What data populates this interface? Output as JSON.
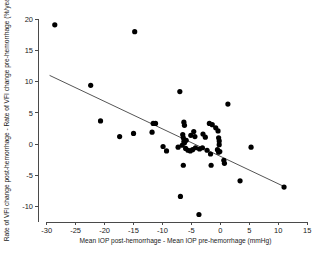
{
  "chart_data": {
    "type": "scatter",
    "title": "",
    "xlabel": "Mean IOP post-hemorrhage - Mean IOP pre-hemorrhage (mmHg)",
    "ylabel": "Rate of VFI change post-hemorrhage - Rate of VFI change pre-hemorrhage (%/year)",
    "xlim": [
      -31.5,
      16.0
    ],
    "ylim": [
      -12.5,
      21.0
    ],
    "xticks": [
      -30,
      -25,
      -20,
      -15,
      -10,
      -5,
      0,
      5,
      10,
      15
    ],
    "yticks": [
      -10,
      -5,
      0,
      5,
      10,
      15,
      20
    ],
    "xtick_labels": [
      "-30",
      "-25",
      "-20",
      "-15",
      "-10",
      "-5",
      "0",
      "5",
      "10",
      "15"
    ],
    "ytick_labels": [
      "-10",
      "-5",
      "0",
      "5",
      "10",
      "15",
      "20"
    ],
    "grid": false,
    "legend": false,
    "marker": "filled-circle",
    "marker_color": "#000000",
    "fit_line": {
      "label": "linear regression",
      "color": "#555555",
      "x_start": -29.5,
      "y_start": 11.0,
      "x_end": 11.2,
      "y_end": -6.9
    },
    "points": [
      {
        "x": -28.6,
        "y": 19.1
      },
      {
        "x": -14.8,
        "y": 18.0
      },
      {
        "x": -22.4,
        "y": 9.4
      },
      {
        "x": -7.0,
        "y": 8.4
      },
      {
        "x": 1.3,
        "y": 6.4
      },
      {
        "x": -20.7,
        "y": 3.7
      },
      {
        "x": -11.6,
        "y": 3.3
      },
      {
        "x": -11.2,
        "y": 3.3
      },
      {
        "x": -6.3,
        "y": 3.5
      },
      {
        "x": -6.2,
        "y": 3.0
      },
      {
        "x": -1.9,
        "y": 3.3
      },
      {
        "x": -1.4,
        "y": 3.1
      },
      {
        "x": -0.8,
        "y": 2.6
      },
      {
        "x": -0.4,
        "y": 2.1
      },
      {
        "x": -15.0,
        "y": 1.7
      },
      {
        "x": -17.4,
        "y": 1.2
      },
      {
        "x": -11.8,
        "y": 1.9
      },
      {
        "x": -6.5,
        "y": 1.5
      },
      {
        "x": -6.4,
        "y": 1.0
      },
      {
        "x": -6.3,
        "y": 0.4
      },
      {
        "x": -6.2,
        "y": 0.2
      },
      {
        "x": -5.9,
        "y": 0.6
      },
      {
        "x": -5.1,
        "y": 1.4
      },
      {
        "x": -4.6,
        "y": 2.0
      },
      {
        "x": -4.4,
        "y": 1.2
      },
      {
        "x": -3.0,
        "y": 1.6
      },
      {
        "x": -2.6,
        "y": 1.1
      },
      {
        "x": -0.3,
        "y": 1.0
      },
      {
        "x": -0.2,
        "y": 0.5
      },
      {
        "x": -0.2,
        "y": -0.1
      },
      {
        "x": -9.9,
        "y": -0.4
      },
      {
        "x": -9.3,
        "y": -1.1
      },
      {
        "x": -7.3,
        "y": -0.5
      },
      {
        "x": -6.6,
        "y": -0.2
      },
      {
        "x": -6.0,
        "y": -0.7
      },
      {
        "x": -5.6,
        "y": -1.0
      },
      {
        "x": -5.2,
        "y": -1.1
      },
      {
        "x": -4.8,
        "y": -0.9
      },
      {
        "x": -4.3,
        "y": -0.6
      },
      {
        "x": -3.6,
        "y": -0.8
      },
      {
        "x": -3.1,
        "y": -0.6
      },
      {
        "x": -2.3,
        "y": -1.0
      },
      {
        "x": -1.7,
        "y": -1.6
      },
      {
        "x": -0.5,
        "y": -0.9
      },
      {
        "x": -0.3,
        "y": -1.3
      },
      {
        "x": -0.1,
        "y": -1.2
      },
      {
        "x": 5.3,
        "y": -0.5
      },
      {
        "x": -6.4,
        "y": -3.4
      },
      {
        "x": -1.6,
        "y": -3.4
      },
      {
        "x": 0.6,
        "y": -2.6
      },
      {
        "x": 0.7,
        "y": -3.1
      },
      {
        "x": 3.4,
        "y": -5.9
      },
      {
        "x": 11.0,
        "y": -6.9
      },
      {
        "x": -6.9,
        "y": -8.4
      },
      {
        "x": -3.7,
        "y": -11.3
      }
    ]
  }
}
